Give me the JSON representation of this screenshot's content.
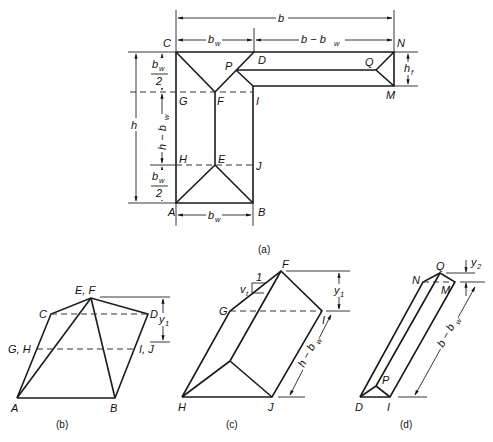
{
  "figure": {
    "captions": {
      "a": "(a)",
      "b": "(b)",
      "c": "(c)",
      "d": "(d)"
    },
    "panel_a": {
      "points": {
        "C": "C",
        "D": "D",
        "N": "N",
        "P": "P",
        "Q": "Q",
        "G": "G",
        "F": "F",
        "I": "I",
        "M": "M",
        "H": "H",
        "E": "E",
        "J": "J",
        "A": "A",
        "B": "B"
      },
      "dimensions": {
        "b": "b",
        "bw_top": "b",
        "bw_top_sub": "w",
        "b_minus_bw": "b − b",
        "b_minus_bw_sub": "w",
        "hf": "h",
        "hf_sub": "f",
        "h": "h",
        "bw_half_top_num": "b",
        "bw_half_top_sub": "w",
        "bw_half_top_den": "2",
        "h_minus_bw": "h − b",
        "h_minus_bw_sub": "w",
        "bw_half_bot_num": "b",
        "bw_half_bot_sub": "w",
        "bw_half_bot_den": "2",
        "bw_bottom": "b",
        "bw_bottom_sub": "w"
      }
    },
    "panel_b": {
      "points": {
        "EF": "E, F",
        "C": "C",
        "D": "D",
        "GH": "G, H",
        "IJ": "I, J",
        "A": "A",
        "B": "B"
      },
      "dimensions": {
        "y1": "y",
        "y1_sub": "1"
      }
    },
    "panel_c": {
      "points": {
        "F": "F",
        "G": "G",
        "I": "I",
        "H": "H",
        "J": "J"
      },
      "dimensions": {
        "slope_run": "1",
        "vt": "v",
        "vt_sub": "t",
        "y1": "y",
        "y1_sub": "1",
        "h_minus_bw": "h − b",
        "h_minus_bw_sub": "w"
      }
    },
    "panel_d": {
      "points": {
        "Q": "Q",
        "N": "N",
        "M": "M",
        "P": "P",
        "D": "D",
        "I": "I"
      },
      "dimensions": {
        "y2": "y",
        "y2_sub": "2",
        "b_minus_bw": "b − b",
        "b_minus_bw_sub": "w"
      }
    }
  }
}
